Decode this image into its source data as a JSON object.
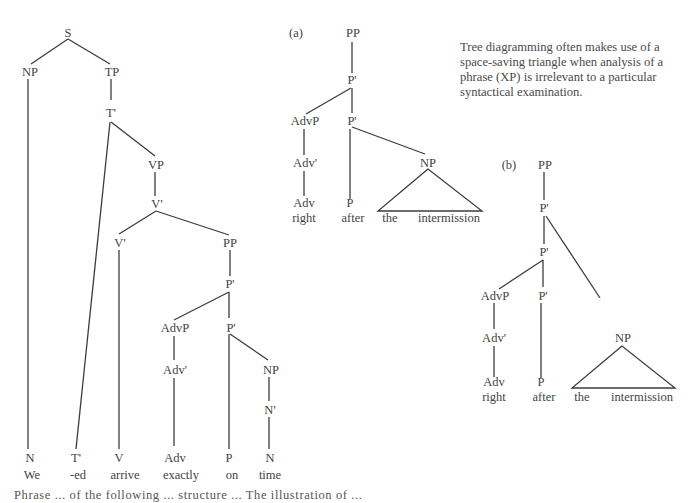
{
  "main_tree": {
    "nodes": {
      "S": "S",
      "NP": "NP",
      "TP": "TP",
      "T_bar": "T'",
      "VP": "VP",
      "V_bar_top": "V'",
      "V_bar": "V'",
      "PP": "PP",
      "P_bar_top": "P'",
      "AdvP": "AdvP",
      "P_bar": "P'",
      "Adv_bar": "Adv'",
      "NP2": "NP",
      "N_bar": "N'"
    },
    "leaves": [
      {
        "cat": "N",
        "word": "We"
      },
      {
        "cat": "T'",
        "word": "-ed"
      },
      {
        "cat": "V",
        "word": "arrive"
      },
      {
        "cat": "Adv",
        "word": "exactly"
      },
      {
        "cat": "P",
        "word": "on"
      },
      {
        "cat": "N",
        "word": "time"
      }
    ]
  },
  "tree_a": {
    "label": "(a)",
    "nodes": {
      "PP": "PP",
      "P_bar_top": "P'",
      "AdvP": "AdvP",
      "P_bar": "P'",
      "Adv_bar": "Adv'",
      "NP": "NP"
    },
    "leaves": [
      {
        "cat": "Adv",
        "word": "right"
      },
      {
        "cat": "P",
        "word": "after"
      }
    ],
    "triangle_words": [
      "the",
      "intermission"
    ]
  },
  "tree_b": {
    "label": "(b)",
    "nodes": {
      "PP": "PP",
      "P_bar_top": "P'",
      "P_bar_mid": "P'",
      "AdvP": "AdvP",
      "P_bar": "P'",
      "Adv_bar": "Adv'",
      "NP": "NP"
    },
    "leaves": [
      {
        "cat": "Adv",
        "word": "right"
      },
      {
        "cat": "P",
        "word": "after"
      }
    ],
    "triangle_words": [
      "the",
      "intermission"
    ]
  },
  "note": {
    "lines": [
      "Tree diagramming often makes use of a",
      "space-saving triangle when analysis of a",
      "phrase (XP) is irrelevant to a particular",
      "syntactical examination."
    ]
  },
  "caption": {
    "partial_text": "Phrase ... of the following ... structure ... The illustration of ..."
  }
}
